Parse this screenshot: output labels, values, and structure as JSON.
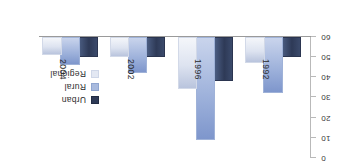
{
  "chart_data": {
    "type": "bar",
    "title": "",
    "subtitle": "",
    "xlabel": "",
    "ylabel": "",
    "categories": [
      "1992",
      "1996",
      "2002",
      "2004"
    ],
    "series": [
      {
        "name": "Urban",
        "color": "#2e3a57",
        "values": [
          9,
          21,
          9,
          9
        ]
      },
      {
        "name": "Rural",
        "color": "#a8bade",
        "values": [
          27,
          50,
          17,
          13
        ]
      },
      {
        "name": "Regional",
        "color": "#e3e8f3",
        "values": [
          12,
          25,
          9,
          8
        ]
      }
    ],
    "ylim": [
      0,
      60
    ],
    "yticks": [
      0,
      10,
      20,
      30,
      40,
      50,
      60
    ],
    "ytick_labels": [
      "0",
      "10",
      "20",
      "30",
      "40",
      "50",
      "60"
    ],
    "grid": false,
    "legend_position": "right",
    "orientation": "rotated-180"
  },
  "axis": {
    "tick_labels": [
      "0",
      "10",
      "20",
      "30",
      "40",
      "50",
      "60"
    ]
  },
  "categories": {
    "labels": [
      "1992",
      "1996",
      "2002",
      "2004"
    ]
  },
  "legend": {
    "items": [
      {
        "label": "Urban"
      },
      {
        "label": "Rural"
      },
      {
        "label": "Regional"
      }
    ]
  }
}
